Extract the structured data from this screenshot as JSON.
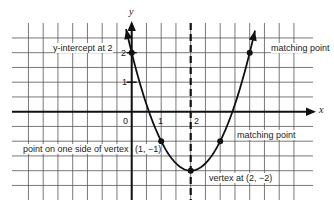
{
  "diagram": {
    "type": "parabola-graph",
    "equation_depicted": "y = (x - 2)^2 - 2",
    "axes": {
      "x_label": "x",
      "y_label": "y",
      "x_ticks": [
        "0",
        "1",
        "2"
      ],
      "y_ticks": [
        "1",
        "2"
      ],
      "grid_step": 0.5,
      "x_range": [
        -4.5,
        5.5
      ],
      "y_range": [
        -3,
        3
      ]
    },
    "axis_of_symmetry": {
      "x": 2,
      "style": "dashed"
    },
    "points": [
      {
        "x": 0,
        "y": 2,
        "label": "y-intercept at 2"
      },
      {
        "x": 1,
        "y": -1,
        "label": "point on one side of vertex",
        "coord_label": "(1, −1)"
      },
      {
        "x": 2,
        "y": -2,
        "label": "vertex at (2, −2)"
      },
      {
        "x": 3,
        "y": -1,
        "label": "matching point"
      },
      {
        "x": 4,
        "y": 2,
        "label": "matching point"
      }
    ],
    "colors": {
      "line": "#1a1a1a",
      "grid": "#555555",
      "background": "#ffffff"
    }
  },
  "labels": {
    "y_intercept": "y-intercept at 2",
    "matching_point_top": "matching point",
    "matching_point_bottom": "matching point",
    "point_side": "point on one side of vertex",
    "point_side_coord": "(1, −1)",
    "vertex": "vertex at (2, −2)",
    "tick_0": "0",
    "tick_x1": "1",
    "tick_x2": "2",
    "tick_y1": "1",
    "tick_y2": "2",
    "x_axis": "x",
    "y_axis": "y"
  }
}
